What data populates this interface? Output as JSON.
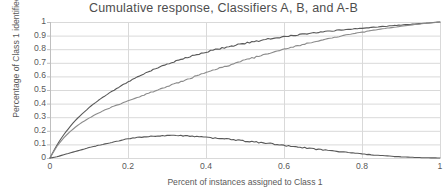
{
  "chart_data": {
    "type": "line",
    "title": "Cumulative response, Classifiers A, B, and A-B",
    "xlabel": "Percent of instances assigned to Class 1",
    "ylabel": "Percentage of Class 1 identified",
    "xlim": [
      0,
      1
    ],
    "ylim": [
      0,
      1
    ],
    "xticks": [
      "0",
      "0.2",
      "0.4",
      "0.6",
      "0.8",
      "1"
    ],
    "xtick_values": [
      0,
      0.2,
      0.4,
      0.6,
      0.8,
      1
    ],
    "yticks": [
      "0",
      "0.1",
      "0.2",
      "0.3",
      "0.4",
      "0.5",
      "0.6",
      "0.7",
      "0.8",
      "0.9",
      "1"
    ],
    "ytick_values": [
      0,
      0.1,
      0.2,
      0.3,
      0.4,
      0.5,
      0.6,
      0.7,
      0.8,
      0.9,
      1
    ],
    "grid": true,
    "legend": "none",
    "colors": {
      "classifier_a": "#595959",
      "classifier_b": "#8c8c8c",
      "difference": "#595959",
      "gridline": "#d9d9d9",
      "axis": "#bfbfbf"
    },
    "series": [
      {
        "name": "Classifier A",
        "color": "#595959",
        "x": [
          0,
          0.01,
          0.02,
          0.03,
          0.04,
          0.05,
          0.06,
          0.07,
          0.08,
          0.09,
          0.1,
          0.12,
          0.14,
          0.16,
          0.18,
          0.2,
          0.22,
          0.24,
          0.26,
          0.28,
          0.3,
          0.33,
          0.36,
          0.39,
          0.42,
          0.45,
          0.48,
          0.51,
          0.54,
          0.57,
          0.6,
          0.64,
          0.68,
          0.72,
          0.76,
          0.8,
          0.84,
          0.88,
          0.92,
          0.96,
          1.0
        ],
        "values": [
          0,
          0.055,
          0.105,
          0.15,
          0.19,
          0.225,
          0.26,
          0.29,
          0.318,
          0.344,
          0.37,
          0.415,
          0.455,
          0.492,
          0.527,
          0.56,
          0.59,
          0.618,
          0.644,
          0.668,
          0.69,
          0.72,
          0.747,
          0.771,
          0.793,
          0.813,
          0.832,
          0.849,
          0.865,
          0.88,
          0.893,
          0.908,
          0.922,
          0.934,
          0.945,
          0.955,
          0.964,
          0.973,
          0.982,
          0.991,
          1.0
        ]
      },
      {
        "name": "Classifier B",
        "color": "#8c8c8c",
        "x": [
          0,
          0.01,
          0.02,
          0.03,
          0.04,
          0.05,
          0.06,
          0.07,
          0.08,
          0.09,
          0.1,
          0.12,
          0.14,
          0.16,
          0.18,
          0.2,
          0.22,
          0.24,
          0.26,
          0.28,
          0.3,
          0.33,
          0.36,
          0.39,
          0.42,
          0.45,
          0.48,
          0.51,
          0.54,
          0.57,
          0.6,
          0.64,
          0.68,
          0.72,
          0.76,
          0.8,
          0.84,
          0.88,
          0.92,
          0.96,
          1.0
        ],
        "values": [
          0,
          0.05,
          0.095,
          0.13,
          0.162,
          0.19,
          0.215,
          0.238,
          0.258,
          0.276,
          0.293,
          0.325,
          0.352,
          0.377,
          0.398,
          0.418,
          0.44,
          0.462,
          0.484,
          0.505,
          0.525,
          0.556,
          0.587,
          0.617,
          0.646,
          0.674,
          0.701,
          0.727,
          0.752,
          0.776,
          0.8,
          0.829,
          0.856,
          0.881,
          0.904,
          0.925,
          0.944,
          0.961,
          0.976,
          0.989,
          1.0
        ]
      },
      {
        "name": "A-B",
        "color": "#595959",
        "x": [
          0,
          0.01,
          0.02,
          0.03,
          0.04,
          0.05,
          0.06,
          0.07,
          0.08,
          0.09,
          0.1,
          0.12,
          0.14,
          0.16,
          0.18,
          0.2,
          0.22,
          0.24,
          0.26,
          0.28,
          0.3,
          0.33,
          0.36,
          0.39,
          0.42,
          0.45,
          0.48,
          0.51,
          0.54,
          0.57,
          0.6,
          0.64,
          0.68,
          0.72,
          0.76,
          0.8,
          0.84,
          0.88,
          0.92,
          0.96,
          1.0
        ],
        "values": [
          0,
          0.005,
          0.01,
          0.02,
          0.028,
          0.035,
          0.045,
          0.052,
          0.06,
          0.068,
          0.077,
          0.09,
          0.103,
          0.115,
          0.129,
          0.142,
          0.15,
          0.156,
          0.16,
          0.163,
          0.165,
          0.164,
          0.16,
          0.154,
          0.147,
          0.139,
          0.131,
          0.122,
          0.113,
          0.104,
          0.093,
          0.079,
          0.066,
          0.053,
          0.041,
          0.03,
          0.02,
          0.012,
          0.006,
          0.002,
          0.0
        ]
      }
    ]
  }
}
